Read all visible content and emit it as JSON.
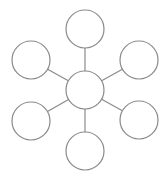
{
  "diagram": {
    "type": "hub-and-spoke",
    "colors": {
      "stroke": "#8a8a8a",
      "node_fill": "#ffffff",
      "background": "#ffffff"
    },
    "hub": {
      "id": "center",
      "label": ""
    },
    "spokes": [
      {
        "id": "top",
        "label": ""
      },
      {
        "id": "top-right",
        "label": ""
      },
      {
        "id": "bottom-right",
        "label": ""
      },
      {
        "id": "bottom",
        "label": ""
      },
      {
        "id": "bottom-left",
        "label": ""
      },
      {
        "id": "top-left",
        "label": ""
      }
    ]
  }
}
